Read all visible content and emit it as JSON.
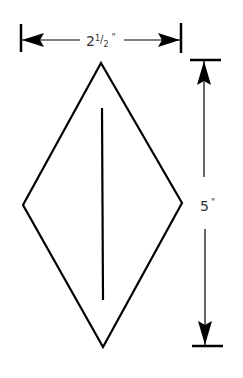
{
  "diagram": {
    "shape": "diamond",
    "width_label": "2½\"",
    "width_label_whole": "2",
    "width_label_num": "1",
    "width_label_den": "2",
    "width_label_inch": "\"",
    "height_label": "5\"",
    "height_label_num": "5",
    "height_label_inch": "\"",
    "stroke_color": "#000000",
    "background_color": "#ffffff"
  }
}
